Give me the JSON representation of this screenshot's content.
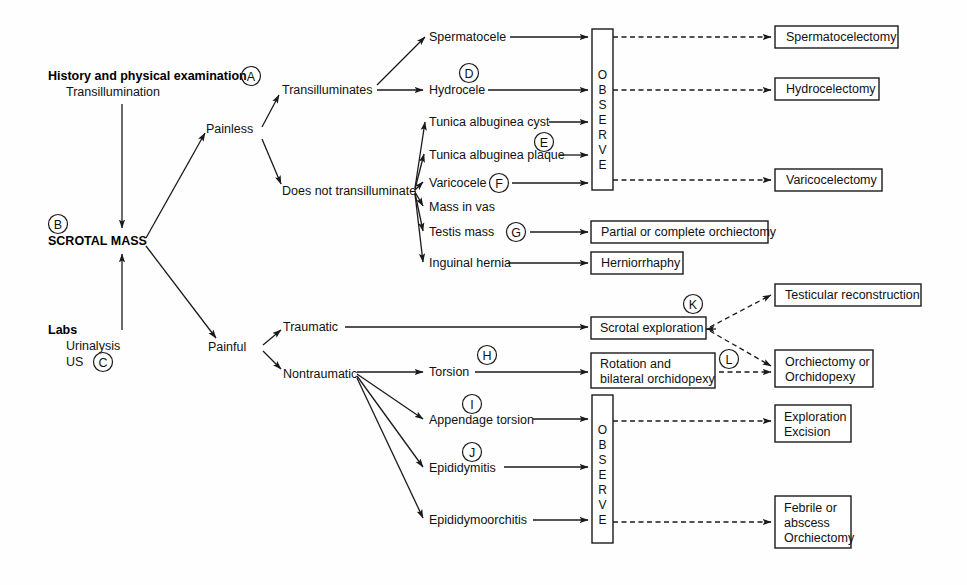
{
  "diagram": {
    "root": {
      "history_heading": "History and physical examination",
      "history_sub": "Transillumination",
      "history_letter": "A",
      "center_node": "SCROTAL MASS",
      "center_letter": "B",
      "labs_heading": "Labs",
      "labs_line1": "Urinalysis",
      "labs_line2": "US",
      "labs_letter": "C"
    },
    "branches": {
      "painless": "Painless",
      "painful": "Painful",
      "transilluminates": "Transilluminates",
      "does_not_transilluminate": "Does not transilluminate",
      "traumatic": "Traumatic",
      "nontraumatic": "Nontraumatic"
    },
    "painless_diagnoses": [
      {
        "label": "Spermatocele",
        "letter": ""
      },
      {
        "label": "Hydrocele",
        "letter": "D"
      },
      {
        "label": "Tunica albuginea cyst",
        "letter": ""
      },
      {
        "label": "Tunica albuginea plaque",
        "letter": "E"
      },
      {
        "label": "Varicocele",
        "letter": "F"
      },
      {
        "label": "Mass in vas",
        "letter": ""
      },
      {
        "label": "Testis mass",
        "letter": "G"
      },
      {
        "label": "Inguinal hernia",
        "letter": ""
      }
    ],
    "painful_diagnoses": [
      {
        "label": "Torsion",
        "letter": "H"
      },
      {
        "label": "Appendage torsion",
        "letter": "I"
      },
      {
        "label": "Epididymitis",
        "letter": "J"
      },
      {
        "label": "Epididymoorchitis",
        "letter": ""
      }
    ],
    "observe_boxes": [
      {
        "name": "observe-top",
        "letters": [
          "O",
          "B",
          "S",
          "E",
          "R",
          "V",
          "E"
        ]
      },
      {
        "name": "observe-bottom",
        "letters": [
          "O",
          "B",
          "S",
          "E",
          "R",
          "V",
          "E"
        ]
      }
    ],
    "outcome_boxes": [
      {
        "id": "spermatocelectomy",
        "lines": [
          "Spermatocelectomy"
        ]
      },
      {
        "id": "hydrocelectomy",
        "lines": [
          "Hydrocelectomy"
        ]
      },
      {
        "id": "varicocelectomy",
        "lines": [
          "Varicocelectomy"
        ]
      },
      {
        "id": "partial-or-complete-orchiectomy",
        "lines": [
          "Partial or complete orchiectomy"
        ]
      },
      {
        "id": "herniorrhaphy",
        "lines": [
          "Herniorrhaphy"
        ]
      },
      {
        "id": "scrotal-exploration",
        "lines": [
          "Scrotal exploration"
        ]
      },
      {
        "id": "rotation-bilateral-orchidopexy",
        "lines": [
          "Rotation and",
          "bilateral orchidopexy"
        ]
      },
      {
        "id": "testicular-reconstruction",
        "lines": [
          "Testicular reconstruction"
        ]
      },
      {
        "id": "orchiectomy-or-orchidopexy",
        "lines": [
          "Orchiectomy or",
          "Orchidopexy"
        ]
      },
      {
        "id": "exploration-excision",
        "lines": [
          "Exploration",
          "Excision"
        ]
      },
      {
        "id": "febrile-abscess-orchiectomy",
        "lines": [
          "Febrile or",
          "abscess",
          "Orchiectomy"
        ]
      }
    ],
    "annotation_letters": {
      "k": "K",
      "l": "L"
    },
    "colors": {
      "line": "#1a1a1a",
      "text": "#111111",
      "background": "#ffffff"
    }
  }
}
